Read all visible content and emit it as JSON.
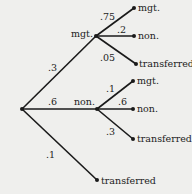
{
  "diagram": {
    "type": "probability-tree",
    "root": {
      "branches": [
        {
          "label": "mgt.",
          "probability": ".3",
          "branches": [
            {
              "label": "mgt.",
              "probability": ".75"
            },
            {
              "label": "non.",
              "probability": ".2"
            },
            {
              "label": "transferred",
              "probability": ".05"
            }
          ]
        },
        {
          "label": "non.",
          "probability": ".6",
          "branches": [
            {
              "label": "mgt.",
              "probability": ".1"
            },
            {
              "label": "non.",
              "probability": ".6"
            },
            {
              "label": "transferred",
              "probability": ".3"
            }
          ]
        },
        {
          "label": "transferred",
          "probability": ".1"
        }
      ]
    }
  },
  "labels": {
    "l1_mgt": "mgt.",
    "l1_non": "non.",
    "l1_transferred": "transferred",
    "p_root_mgt": ".3",
    "p_root_non": ".6",
    "p_root_transferred": ".1",
    "mgt_mgt": "mgt.",
    "mgt_non": "non.",
    "mgt_transferred": "transferred",
    "p_mgt_mgt": ".75",
    "p_mgt_non": ".2",
    "p_mgt_transferred": ".05",
    "non_mgt": "mgt.",
    "non_non": "non.",
    "non_transferred": "transferred",
    "p_non_mgt": ".1",
    "p_non_non": ".6",
    "p_non_transferred": ".3"
  },
  "colors": {
    "background": "#efefed",
    "line": "#1a1a1a",
    "text": "#222222"
  }
}
